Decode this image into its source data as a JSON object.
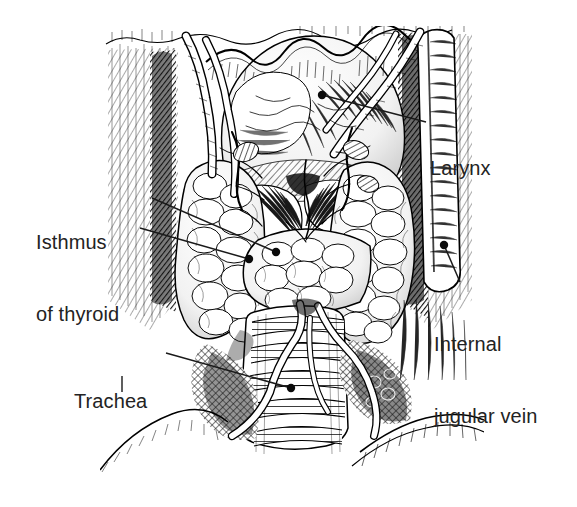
{
  "figure": {
    "style": "pen-and-ink engraving / stipple-hatch line drawing",
    "background_color": "#ffffff",
    "ink_color": "#000000",
    "text_color": "#232323",
    "width": 577,
    "height": 507
  },
  "labels": {
    "larynx": {
      "text": "Larynx",
      "lines": [
        "Larynx"
      ],
      "leader_from": [
        426,
        122
      ],
      "leader_to": [
        322,
        95
      ],
      "dot_at": [
        322,
        95
      ]
    },
    "isthmus": {
      "text": "Isthmus of thyroid",
      "lines": [
        "Isthmus",
        "of thyroid"
      ],
      "leader_from": [
        152,
        198
      ],
      "leader_to": [
        276,
        252
      ],
      "dot_at": [
        276,
        252
      ],
      "leader2_from": [
        140,
        228
      ],
      "leader2_to": [
        249,
        259
      ],
      "dot2_at": [
        249,
        259
      ]
    },
    "jugular": {
      "text": "Internal jugular vein",
      "lines": [
        "Internal",
        "jugular vein"
      ],
      "leader_from": [
        460,
        282
      ],
      "leader_to": [
        444,
        245
      ],
      "dot_at": [
        444,
        245
      ]
    },
    "trachea": {
      "text": "Trachea",
      "lines": [
        "Trachea"
      ],
      "leader_from": [
        166,
        353
      ],
      "leader_to": [
        291,
        388
      ],
      "dot_at": [
        291,
        388
      ]
    }
  },
  "structures": [
    {
      "name": "larynx",
      "region": "superior midline, wavy-crested thyroid cartilage"
    },
    {
      "name": "thyroid-gland-left-lobe",
      "region": "left of midline, lobulated"
    },
    {
      "name": "thyroid-gland-right-lobe",
      "region": "right of midline, lobulated"
    },
    {
      "name": "isthmus-of-thyroid",
      "region": "midline band joining the two lobes"
    },
    {
      "name": "trachea",
      "region": "inferior midline, banded cartilage rings"
    },
    {
      "name": "internal-jugular-vein",
      "region": "right lateral vertical vessel"
    },
    {
      "name": "sternocleidomastoid-muscle",
      "region": "lateral hatched muscle columns"
    },
    {
      "name": "clavicle-and-sternum",
      "region": "inferior curved bony borders"
    },
    {
      "name": "thyroid-vessels",
      "region": "branching superior and inferior thyroid arteries/veins"
    }
  ]
}
